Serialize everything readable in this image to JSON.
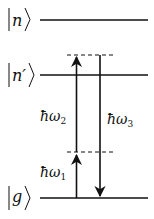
{
  "diagram": {
    "levels": [
      {
        "id": "n",
        "label": "n",
        "y": 20
      },
      {
        "id": "n_prime",
        "label": "n′",
        "y": 75
      },
      {
        "id": "g",
        "label": "g",
        "y": 198
      }
    ],
    "virtual_levels": [
      {
        "id": "virtual_upper",
        "y": 55
      },
      {
        "id": "virtual_lower",
        "y": 152
      }
    ],
    "transitions": [
      {
        "id": "omega1",
        "label": "ħω",
        "subscript": "1",
        "direction": "up"
      },
      {
        "id": "omega2",
        "label": "ħω",
        "subscript": "2",
        "direction": "up"
      },
      {
        "id": "omega3",
        "label": "ħω",
        "subscript": "3",
        "direction": "down"
      }
    ],
    "colors": {
      "line": "#111111",
      "background": "#ffffff"
    }
  }
}
